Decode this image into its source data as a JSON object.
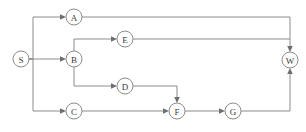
{
  "diagram": {
    "type": "directed-graph",
    "canvas": {
      "width": 306,
      "height": 132
    },
    "style": {
      "edge_color": "#8c8c8c",
      "node_stroke_color": "#8c8c8c",
      "node_fill_color": "#ffffff",
      "label_color": "#3a3a3a",
      "arrow_color": "#6e6e6e",
      "node_radius": 8,
      "stroke_width": 1,
      "background": "#ffffff"
    },
    "nodes": [
      {
        "id": "S",
        "label": "S",
        "x": 21,
        "y": 59,
        "role": "source"
      },
      {
        "id": "A",
        "label": "A",
        "x": 74,
        "y": 17,
        "role": "task"
      },
      {
        "id": "B",
        "label": "B",
        "x": 74,
        "y": 59,
        "role": "task"
      },
      {
        "id": "C",
        "label": "C",
        "x": 74,
        "y": 111,
        "role": "task"
      },
      {
        "id": "E",
        "label": "E",
        "x": 125,
        "y": 39,
        "role": "task"
      },
      {
        "id": "D",
        "label": "D",
        "x": 125,
        "y": 86,
        "role": "task"
      },
      {
        "id": "F",
        "label": "F",
        "x": 177,
        "y": 111,
        "role": "task"
      },
      {
        "id": "G",
        "label": "G",
        "x": 233,
        "y": 111,
        "role": "task"
      },
      {
        "id": "W",
        "label": "W",
        "x": 290,
        "y": 60,
        "role": "sink"
      }
    ],
    "edges": [
      {
        "id": "S-A",
        "from": "S",
        "to": "A",
        "routing": "orthogonal"
      },
      {
        "id": "S-B",
        "from": "S",
        "to": "B",
        "routing": "straight"
      },
      {
        "id": "S-C",
        "from": "S",
        "to": "C",
        "routing": "orthogonal"
      },
      {
        "id": "A-W",
        "from": "A",
        "to": "W",
        "routing": "orthogonal"
      },
      {
        "id": "B-E",
        "from": "B",
        "to": "E",
        "routing": "orthogonal"
      },
      {
        "id": "B-D",
        "from": "B",
        "to": "D",
        "routing": "orthogonal"
      },
      {
        "id": "E-W",
        "from": "E",
        "to": "W",
        "routing": "orthogonal"
      },
      {
        "id": "D-F",
        "from": "D",
        "to": "F",
        "routing": "orthogonal"
      },
      {
        "id": "C-F",
        "from": "C",
        "to": "F",
        "routing": "straight"
      },
      {
        "id": "F-G",
        "from": "F",
        "to": "G",
        "routing": "straight"
      },
      {
        "id": "G-W",
        "from": "G",
        "to": "W",
        "routing": "orthogonal"
      }
    ]
  }
}
